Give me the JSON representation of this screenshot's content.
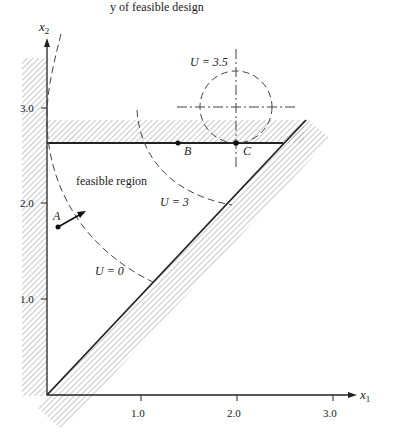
{
  "header": {
    "partial_text": "y of feasible design"
  },
  "axes": {
    "x_label": "x",
    "x_sub": "1",
    "y_label": "x",
    "y_sub": "2",
    "x_ticks": [
      "1.0",
      "2.0",
      "3.0"
    ],
    "y_ticks": [
      "1.0",
      "2.0",
      "3.0"
    ]
  },
  "labels": {
    "feasible_region": "feasible region",
    "point_a": "A",
    "point_b": "B",
    "point_c": "C",
    "u0": "U = 0",
    "u3": "U = 3",
    "u35": "U = 3.5"
  },
  "colors": {
    "ink": "#222222",
    "hatch": "#9a9a9a",
    "contour": "#444444"
  }
}
